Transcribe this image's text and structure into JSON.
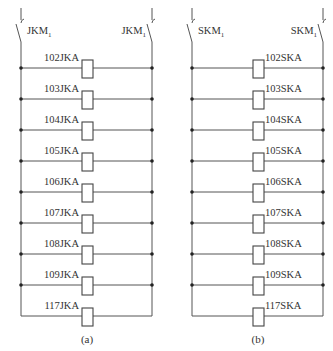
{
  "panels": [
    {
      "id": "a",
      "caption": "(a)",
      "switch_left": {
        "base": "JKM",
        "sub": "1"
      },
      "switch_right": {
        "base": "JKM",
        "sub": "1"
      },
      "rows": [
        "102JKA",
        "103JKA",
        "104JKA",
        "105JKA",
        "106JKA",
        "107JKA",
        "108JKA",
        "109JKA",
        "117JKA"
      ],
      "label_side": "left"
    },
    {
      "id": "b",
      "caption": "(b)",
      "switch_left": {
        "base": "SKM",
        "sub": "1"
      },
      "switch_right": {
        "base": "SKM",
        "sub": "1"
      },
      "rows": [
        "102SKA",
        "103SKA",
        "104SKA",
        "105SKA",
        "106SKA",
        "107SKA",
        "108SKA",
        "109SKA",
        "117SKA"
      ],
      "label_side": "right"
    }
  ]
}
